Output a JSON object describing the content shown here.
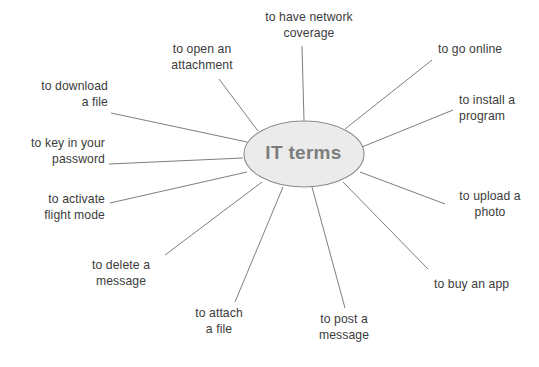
{
  "diagram": {
    "type": "mind-map",
    "title": "IT terms",
    "center": {
      "label": "IT terms",
      "cx": 303.5,
      "cy": 154,
      "rx": 60,
      "ry": 33,
      "fill": "#ebebeb",
      "stroke": "#8c8c8c",
      "text_color": "#7d7d7d"
    },
    "style": {
      "background": "#ffffff",
      "line_color": "#6f6f6f",
      "line_width": 0.9,
      "label_color": "#3b3b3b"
    },
    "branches": [
      {
        "id": "have-network-coverage",
        "label": "to have network\ncoverage",
        "align": "center",
        "text_x": 242,
        "text_y": 10,
        "text_w": 134,
        "line": {
          "x1": 304,
          "y1": 121,
          "x2": 302,
          "y2": 46
        }
      },
      {
        "id": "open-an-attachment",
        "label": "to open an\nattachment",
        "align": "center",
        "text_x": 150,
        "text_y": 42,
        "text_w": 104,
        "line": {
          "x1": 258,
          "y1": 131,
          "x2": 219,
          "y2": 79
        }
      },
      {
        "id": "download-a-file",
        "label": "to download\na file",
        "align": "right",
        "text_x": 36,
        "text_y": 79,
        "text_w": 72,
        "line": {
          "x1": 247,
          "y1": 142,
          "x2": 111,
          "y2": 113
        }
      },
      {
        "id": "key-in-your-password",
        "label": "to key in your\npassword",
        "align": "right",
        "text_x": 21,
        "text_y": 136,
        "text_w": 84,
        "line": {
          "x1": 243,
          "y1": 158,
          "x2": 109,
          "y2": 164
        }
      },
      {
        "id": "activate-flight-mode",
        "label": "to activate\nflight mode",
        "align": "right",
        "text_x": 27,
        "text_y": 192,
        "text_w": 78,
        "line": {
          "x1": 247,
          "y1": 172,
          "x2": 110,
          "y2": 203
        }
      },
      {
        "id": "delete-a-message",
        "label": "to delete a\nmessage",
        "align": "center",
        "text_x": 79,
        "text_y": 258,
        "text_w": 84,
        "line": {
          "x1": 262,
          "y1": 182,
          "x2": 165,
          "y2": 255
        }
      },
      {
        "id": "attach-a-file",
        "label": "to attach\na file",
        "align": "center",
        "text_x": 183,
        "text_y": 306,
        "text_w": 72,
        "line": {
          "x1": 283,
          "y1": 187,
          "x2": 235,
          "y2": 302
        }
      },
      {
        "id": "post-a-message",
        "label": "to post a\nmessage",
        "align": "center",
        "text_x": 306,
        "text_y": 312,
        "text_w": 76,
        "line": {
          "x1": 312,
          "y1": 187,
          "x2": 345,
          "y2": 308
        }
      },
      {
        "id": "buy-an-app",
        "label": "to buy an app",
        "align": "left",
        "text_x": 434,
        "text_y": 277,
        "text_w": 92,
        "line": {
          "x1": 343,
          "y1": 182,
          "x2": 428,
          "y2": 269
        }
      },
      {
        "id": "upload-a-photo",
        "label": "to upload a\nphoto",
        "align": "center",
        "text_x": 451,
        "text_y": 189,
        "text_w": 78,
        "line": {
          "x1": 360,
          "y1": 172,
          "x2": 445,
          "y2": 204
        }
      },
      {
        "id": "install-a-program",
        "label": "to install a\nprogram",
        "align": "left",
        "text_x": 459,
        "text_y": 93,
        "text_w": 72,
        "line": {
          "x1": 362,
          "y1": 147,
          "x2": 453,
          "y2": 110
        }
      },
      {
        "id": "go-online",
        "label": "to go online",
        "align": "left",
        "text_x": 438,
        "text_y": 42,
        "text_w": 88,
        "line": {
          "x1": 345,
          "y1": 129,
          "x2": 432,
          "y2": 60
        }
      }
    ]
  }
}
